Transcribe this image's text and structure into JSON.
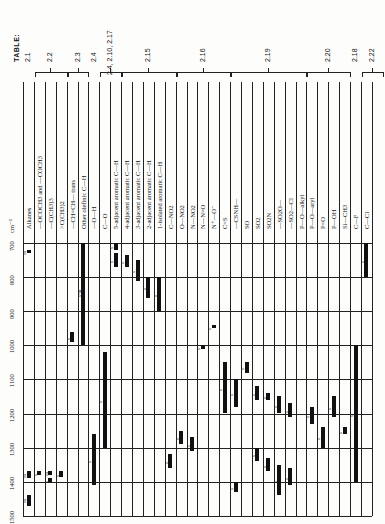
{
  "table_title": "TABLE:",
  "groups": [
    {
      "label": "2.1",
      "from": 0,
      "to": 0
    },
    {
      "label": "2.2",
      "from": 1,
      "to": 3
    },
    {
      "label": "2.3",
      "from": 4,
      "to": 5
    },
    {
      "label": "2.4",
      "from": 6,
      "to": 6
    },
    {
      "label": "2.4, 2.10, 2.17",
      "from": 7,
      "to": 8
    },
    {
      "label": "2.15",
      "from": 9,
      "to": 13
    },
    {
      "label": "2.16",
      "from": 14,
      "to": 18
    },
    {
      "label": "2.19",
      "from": 19,
      "to": 25
    },
    {
      "label": "2.20",
      "from": 26,
      "to": 29
    },
    {
      "label": "2.18",
      "from": 30,
      "to": 30
    },
    {
      "label": "2.22",
      "from": 31,
      "to": 32
    }
  ],
  "axis": {
    "unit_label": "cm⁻¹",
    "ticks": [
      700,
      800,
      900,
      1000,
      1100,
      1200,
      1300,
      1400,
      1500
    ]
  },
  "chart_data": {
    "type": "table",
    "xlabel": "Group / bond",
    "ylabel": "cm⁻¹",
    "ylim": [
      700,
      1500
    ],
    "categories": [
      "Alkanes",
      "—OCOCH3 and —COCH3",
      "—C(CH3)3",
      ">C(CH3)2",
      "—CH=CH— trans",
      "Other olefinic C—H",
      "—O—H",
      "C—O",
      "5-adjacent aromatic C—H",
      "4-adjacent aromatic C—H",
      "3-adjacent aromatic C—H",
      "2-adjacent aromatic C—H",
      "1-isolated aromatic C—H",
      "C—NO2",
      "O—NO2",
      "N—NO2",
      "N—N=O",
      "N⁺—O⁻",
      "C=S",
      "—CSNH—",
      "SO",
      "SO2",
      "SO2N",
      "—SO2O—",
      "—SO2—Cl",
      "P—O—alkyl",
      "P—O—aryl",
      "P=O",
      "P—OH",
      "Si—CH3",
      "C—F",
      "C—Cl"
    ],
    "bands": [
      {
        "col": 0,
        "from": 720,
        "to": 730,
        "intensity": "m"
      },
      {
        "col": 0,
        "from": 1370,
        "to": 1390,
        "intensity": "m"
      },
      {
        "col": 0,
        "from": 1440,
        "to": 1470,
        "intensity": "m"
      },
      {
        "col": 1,
        "from": 1370,
        "to": 1380,
        "intensity": "s"
      },
      {
        "col": 2,
        "from": 1370,
        "to": 1380,
        "intensity": "m"
      },
      {
        "col": 2,
        "from": 1390,
        "to": 1400,
        "intensity": "s"
      },
      {
        "col": 3,
        "from": 1370,
        "to": 1385,
        "intensity": "s"
      },
      {
        "col": 4,
        "from": 960,
        "to": 990,
        "intensity": "s"
      },
      {
        "col": 5,
        "from": 700,
        "to": 1000,
        "intensity": "s-m"
      },
      {
        "col": 6,
        "from": 1260,
        "to": 1410,
        "intensity": "s"
      },
      {
        "col": 7,
        "from": 1020,
        "to": 1300,
        "intensity": "s"
      },
      {
        "col": 8,
        "from": 700,
        "to": 720,
        "intensity": "s"
      },
      {
        "col": 8,
        "from": 730,
        "to": 770,
        "intensity": "s"
      },
      {
        "col": 9,
        "from": 735,
        "to": 770,
        "intensity": "s"
      },
      {
        "col": 10,
        "from": 750,
        "to": 810,
        "intensity": "s"
      },
      {
        "col": 11,
        "from": 800,
        "to": 860,
        "intensity": "s"
      },
      {
        "col": 12,
        "from": 800,
        "to": 900,
        "intensity": "s"
      },
      {
        "col": 13,
        "from": 1320,
        "to": 1360,
        "intensity": "s"
      },
      {
        "col": 14,
        "from": 1250,
        "to": 1290,
        "intensity": "s"
      },
      {
        "col": 15,
        "from": 1270,
        "to": 1310,
        "intensity": "s"
      },
      {
        "col": 16,
        "from": 1000,
        "to": 1010,
        "intensity": "s"
      },
      {
        "col": 17,
        "from": 940,
        "to": 950,
        "intensity": "s"
      },
      {
        "col": 18,
        "from": 1050,
        "to": 1200,
        "intensity": "s"
      },
      {
        "col": 19,
        "from": 1100,
        "to": 1180,
        "intensity": "s"
      },
      {
        "col": 19,
        "from": 1400,
        "to": 1430,
        "intensity": "s"
      },
      {
        "col": 20,
        "from": 1050,
        "to": 1080,
        "intensity": "s"
      },
      {
        "col": 21,
        "from": 1120,
        "to": 1160,
        "intensity": "s"
      },
      {
        "col": 21,
        "from": 1300,
        "to": 1340,
        "intensity": "s"
      },
      {
        "col": 22,
        "from": 1140,
        "to": 1160,
        "intensity": "s"
      },
      {
        "col": 22,
        "from": 1330,
        "to": 1370,
        "intensity": "s"
      },
      {
        "col": 23,
        "from": 1150,
        "to": 1200,
        "intensity": "s"
      },
      {
        "col": 23,
        "from": 1350,
        "to": 1440,
        "intensity": "s"
      },
      {
        "col": 24,
        "from": 1170,
        "to": 1210,
        "intensity": "s"
      },
      {
        "col": 24,
        "from": 1360,
        "to": 1410,
        "intensity": "s"
      },
      {
        "col": 26,
        "from": 1180,
        "to": 1230,
        "intensity": "s"
      },
      {
        "col": 27,
        "from": 1240,
        "to": 1300,
        "intensity": "s"
      },
      {
        "col": 28,
        "from": 1150,
        "to": 1210,
        "intensity": "s"
      },
      {
        "col": 29,
        "from": 1240,
        "to": 1260,
        "intensity": "s"
      },
      {
        "col": 30,
        "from": 1000,
        "to": 1400,
        "intensity": "s"
      },
      {
        "col": 31,
        "from": 700,
        "to": 800,
        "intensity": "s"
      }
    ]
  }
}
